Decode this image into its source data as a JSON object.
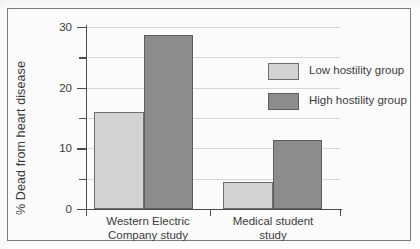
{
  "figure": {
    "background_color": "#fdfdfd",
    "frame_color": "#7c7c7c"
  },
  "chart_data": {
    "type": "bar",
    "title": "",
    "xlabel": "",
    "ylabel": "% Dead from heart disease",
    "categories": [
      "Western Electric\nCompany study",
      "Medical student\nstudy"
    ],
    "series": [
      {
        "name": "Low hostility group",
        "color": "#d2d2d2",
        "values": [
          16.0,
          4.4
        ]
      },
      {
        "name": "High hostility group",
        "color": "#8c8c8c",
        "values": [
          28.7,
          11.4
        ]
      }
    ],
    "ylim": [
      0,
      30
    ],
    "yticks": [
      0,
      5,
      10,
      15,
      20,
      25,
      30
    ],
    "ytick_labels": [
      "0",
      "",
      "10",
      "",
      "20",
      "",
      "30"
    ],
    "grid": true,
    "legend_position": "upper right"
  },
  "axis": {
    "y_label": "% Dead from heart disease",
    "ticks": [
      {
        "value": 30,
        "label": "30",
        "major": true
      },
      {
        "value": 25,
        "label": "",
        "major": false
      },
      {
        "value": 20,
        "label": "20",
        "major": true
      },
      {
        "value": 15,
        "label": "",
        "major": false
      },
      {
        "value": 10,
        "label": "10",
        "major": true
      },
      {
        "value": 5,
        "label": "",
        "major": false
      },
      {
        "value": 0,
        "label": "0",
        "major": true
      }
    ]
  },
  "categories": [
    {
      "id": "western-electric",
      "line1": "Western Electric",
      "line2": "Company study"
    },
    {
      "id": "medical-student",
      "line1": "Medical student",
      "line2": "study"
    }
  ],
  "legend": {
    "items": [
      {
        "id": "low-hostility",
        "label": "Low hostility group",
        "color": "#d2d2d2"
      },
      {
        "id": "high-hostility",
        "label": "High hostility group",
        "color": "#8c8c8c"
      }
    ]
  },
  "bars": [
    {
      "id": "western-electric-low",
      "group": "Western Electric Company study",
      "series": "Low hostility group",
      "value": 16.0
    },
    {
      "id": "western-electric-high",
      "group": "Western Electric Company study",
      "series": "High hostility group",
      "value": 28.7
    },
    {
      "id": "medical-student-low",
      "group": "Medical student study",
      "series": "Low hostility group",
      "value": 4.4
    },
    {
      "id": "medical-student-high",
      "group": "Medical student study",
      "series": "High hostility group",
      "value": 11.4
    }
  ]
}
